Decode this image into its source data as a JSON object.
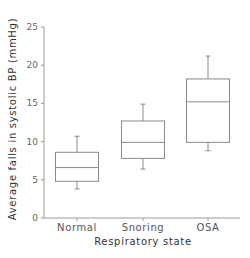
{
  "chart_data": {
    "type": "box",
    "title": "",
    "xlabel": "Respiratory state",
    "ylabel": "Average falls in systolic BP (mmHg)",
    "ylim": [
      0,
      25
    ],
    "yticks": [
      0,
      5,
      10,
      15,
      20,
      25
    ],
    "grid": false,
    "legend": null,
    "categories": [
      "Normal",
      "Snoring",
      "OSA"
    ],
    "boxes": [
      {
        "category": "Normal",
        "whisker_low": 3.8,
        "q1": 4.8,
        "median": 6.6,
        "q3": 8.6,
        "whisker_high": 10.7
      },
      {
        "category": "Snoring",
        "whisker_low": 6.4,
        "q1": 7.8,
        "median": 9.9,
        "q3": 12.7,
        "whisker_high": 14.9
      },
      {
        "category": "OSA",
        "whisker_low": 8.8,
        "q1": 9.9,
        "median": 15.2,
        "q3": 18.2,
        "whisker_high": 21.2
      }
    ],
    "colors": {
      "line": "#8a8a8a",
      "axis": "#999999",
      "text": "#555555"
    }
  }
}
